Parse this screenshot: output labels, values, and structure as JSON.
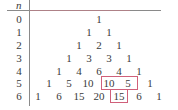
{
  "header": {
    "n_label": "n"
  },
  "rows": [
    {
      "n": "0",
      "values": [
        "1"
      ]
    },
    {
      "n": "1",
      "values": [
        "1",
        "1"
      ]
    },
    {
      "n": "2",
      "values": [
        "1",
        "2",
        "1"
      ]
    },
    {
      "n": "3",
      "values": [
        "1",
        "3",
        "3",
        "1"
      ]
    },
    {
      "n": "4",
      "values": [
        "1",
        "4",
        "6",
        "4",
        "1"
      ]
    },
    {
      "n": "5",
      "values": [
        "1",
        "5",
        "10",
        "10",
        "5",
        "1"
      ]
    },
    {
      "n": "6",
      "values": [
        "1",
        "6",
        "15",
        "20",
        "15",
        "6",
        "1"
      ]
    }
  ],
  "highlights": [
    {
      "row": "5",
      "cells": [
        "10",
        "5"
      ],
      "color": "#d0607a"
    },
    {
      "row": "6",
      "cells": [
        "15"
      ],
      "color": "#d0607a"
    }
  ]
}
